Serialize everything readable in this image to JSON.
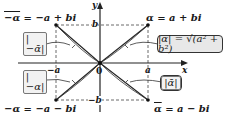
{
  "diagram": {
    "axes": {
      "x_label": "x",
      "y_label": "y",
      "origin_label": "0"
    },
    "ticks": {
      "a": "a",
      "neg_a": "−a",
      "b": "b",
      "neg_b": "−b"
    },
    "points": [
      {
        "id": "alpha",
        "label_sym": "α",
        "label_rest": " = a + bi",
        "quadrant": "I"
      },
      {
        "id": "neg-alpha-bar",
        "label_sym": "−α",
        "label_rest": " = −a + bi",
        "quadrant": "II",
        "bar": true
      },
      {
        "id": "neg-alpha",
        "label_sym": "−α",
        "label_rest": " = −a − bi",
        "quadrant": "III"
      },
      {
        "id": "alpha-bar",
        "label_sym": "α",
        "label_rest": " = a − bi",
        "quadrant": "IV",
        "bar": true
      }
    ],
    "callouts": {
      "modulus_alpha": "|α| = √(a² + b²)",
      "modulus_neg_alpha_bar": "|−ᾱ|",
      "modulus_neg_alpha": "|−α|",
      "modulus_alpha_bar": "|ᾱ|"
    },
    "colors": {
      "line": "#222222",
      "dashed": "#444444",
      "box_fill": "#e8e8e8"
    }
  }
}
